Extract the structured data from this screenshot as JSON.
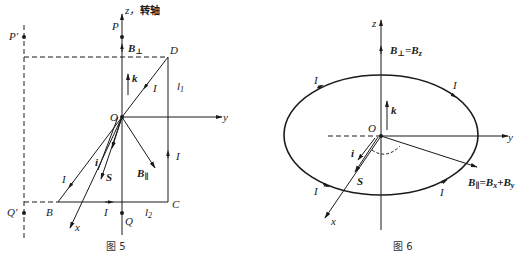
{
  "figure5": {
    "caption": "图 5",
    "axis_z_label": "z，",
    "axis_z_note": "转轴",
    "axis_y_label": "y",
    "axis_x_label": "x",
    "origin_label": "O",
    "points": {
      "P": "P",
      "P_prime": "P′",
      "Q": "Q",
      "Q_prime": "Q′",
      "B": "B",
      "C": "C",
      "D": "D"
    },
    "vectors": {
      "B_perp": "B",
      "B_perp_sub": "⊥",
      "B_par": "B",
      "B_par_sub": "∥",
      "k": "k",
      "i": "i",
      "S": "S"
    },
    "lengths": {
      "l1": "l",
      "l1_sub": "1",
      "l2": "l",
      "l2_sub": "2"
    },
    "current_label": "I"
  },
  "figure6": {
    "caption": "图 6",
    "axis_z_label": "z",
    "axis_y_label": "y",
    "axis_x_label": "x",
    "origin_label": "O",
    "vectors": {
      "B_perp_eq": "B",
      "B_perp_eq_sub": "⊥",
      "B_perp_eq_rhs": "=B",
      "B_perp_eq_rhs_sub": "z",
      "B_par_eq": "B",
      "B_par_eq_sub": "∥",
      "B_par_eq_rhs1": "=B",
      "B_par_eq_rhs1_sub": "x",
      "B_par_eq_rhs2": "+B",
      "B_par_eq_rhs2_sub": "y",
      "k": "k",
      "i": "i",
      "S": "S"
    },
    "current_label": "I"
  }
}
